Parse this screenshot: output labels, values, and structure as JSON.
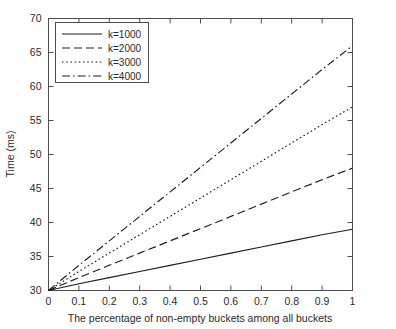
{
  "chart_data": {
    "type": "line",
    "title": "",
    "xlabel": "The percentage of non-empty buckets among all buckets",
    "ylabel": "Time (ms)",
    "xlim": [
      0,
      1
    ],
    "ylim": [
      30,
      70
    ],
    "grid": false,
    "legend_position": "top-left",
    "xticks": [
      "0",
      "0.1",
      "0.2",
      "0.3",
      "0.4",
      "0.5",
      "0.6",
      "0.7",
      "0.8",
      "0.9",
      "1"
    ],
    "xtick_values": [
      0,
      0.1,
      0.2,
      0.3,
      0.4,
      0.5,
      0.6,
      0.7,
      0.8,
      0.9,
      1
    ],
    "yticks": [
      "30",
      "35",
      "40",
      "45",
      "50",
      "55",
      "60",
      "65",
      "70"
    ],
    "ytick_values": [
      30,
      35,
      40,
      45,
      50,
      55,
      60,
      65,
      70
    ],
    "x": [
      0,
      0.1,
      0.2,
      0.3,
      0.4,
      0.5,
      0.6,
      0.7,
      0.8,
      0.9,
      1
    ],
    "series": [
      {
        "name": "k=1000",
        "style": "solid",
        "dash": "none",
        "color": "#1c1c1c",
        "values": [
          30.0,
          31.0,
          31.9,
          32.8,
          33.7,
          34.6,
          35.5,
          36.4,
          37.3,
          38.2,
          39.0
        ]
      },
      {
        "name": "k=2000",
        "style": "dashed",
        "dash": "8,4",
        "color": "#1c1c1c",
        "values": [
          30.0,
          31.9,
          33.7,
          35.5,
          37.3,
          39.1,
          40.9,
          42.7,
          44.5,
          46.3,
          48.0
        ]
      },
      {
        "name": "k=3000",
        "style": "dotted",
        "dash": "1.6,2.6",
        "color": "#1c1c1c",
        "values": [
          30.0,
          32.8,
          35.5,
          38.2,
          40.9,
          43.6,
          46.3,
          49.0,
          51.7,
          54.4,
          57.0
        ]
      },
      {
        "name": "k=4000",
        "style": "dashdot",
        "dash": "8,3,1.6,3",
        "color": "#1c1c1c",
        "values": [
          30.0,
          33.7,
          37.3,
          40.9,
          44.5,
          48.1,
          51.7,
          55.3,
          58.9,
          62.5,
          66.0
        ]
      }
    ]
  },
  "legend": {
    "entries": [
      {
        "label": "k=1000"
      },
      {
        "label": "k=2000"
      },
      {
        "label": "k=3000"
      },
      {
        "label": "k=4000"
      }
    ]
  }
}
